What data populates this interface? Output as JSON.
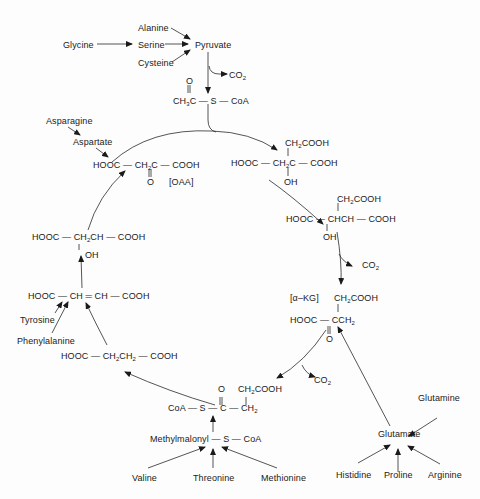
{
  "diagram": {
    "type": "metabolic-pathway",
    "cycle_name": "Citric acid cycle (amino acid entry points)",
    "amino_acids": {
      "top": [
        "Alanine",
        "Glycine",
        "Serine",
        "Cysteine"
      ],
      "pyruvate": "Pyruvate",
      "oaa_feeders": [
        "Asparagine",
        "Aspartate"
      ],
      "fumarate_feeders": [
        "Tyrosine",
        "Phenylalanine"
      ],
      "succinyl_feeders": [
        "Valine",
        "Threonine",
        "Methionine"
      ],
      "methylmalonyl": "Methylmalonyl",
      "glutamate_feeders": [
        "Glutamine",
        "Histidine",
        "Proline",
        "Arginine"
      ],
      "glutamate": "Glutamate"
    },
    "labels": {
      "co2": "CO",
      "co2_sub": "2",
      "oaa": "[OAA]",
      "akg": "[α–KG]",
      "coa": "CoA",
      "s": "S",
      "o": "O",
      "oh": "OH",
      "hooc": "HOOC",
      "cooh": "COOH"
    },
    "compounds": {
      "acetyl_coa": "CH3C(=O)–S–CoA",
      "oxaloacetate": "HOOC–CH2C(=O)–COOH",
      "citrate": "HOOC–CH2C(OH)(CH2COOH)–COOH",
      "isocitrate": "HOOC–CH(OH)CH(CH2COOH)–COOH",
      "alpha_ketoglutarate": "HOOC–C(=O)CH2–CH2COOH",
      "succinyl_coa": "CoA–S–C(=O)–CH2–CH2COOH",
      "succinate": "HOOC–CH2CH2–COOH",
      "fumarate": "HOOC–CH=CH–COOH",
      "malate": "HOOC–CH2CH(OH)–COOH"
    }
  }
}
